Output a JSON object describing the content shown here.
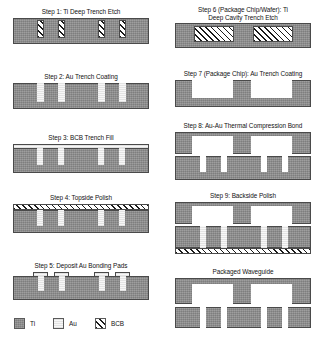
{
  "figure": {
    "colors": {
      "ti": "#8d8d8d",
      "au": "#efefef",
      "bcb_line": "#1a1a1a",
      "background": "#ffffff",
      "outline": "#4a4a4a",
      "text": "#121212"
    }
  },
  "left_column": {
    "steps": [
      {
        "id": "step-1",
        "caption": "Step 1: Ti Deep Trench Etch",
        "description": "Ti substrate with four narrow deep trenches"
      },
      {
        "id": "step-2",
        "caption": "Step 2: Au Trench Coating",
        "description": "Au lining deposited into the four trenches"
      },
      {
        "id": "step-3",
        "caption": "Step 3: BCB Trench Fill",
        "description": "BCB overcoat layer covering the coated trenches"
      },
      {
        "id": "step-4",
        "caption": "Step 4: Topside Polish",
        "description": "Topside planarized leaving a BCB band on the surface"
      },
      {
        "id": "step-5",
        "caption": "Step 5: Deposit Au Bonding Pads",
        "description": "Au bonding pads deposited above each Au-filled trench"
      }
    ]
  },
  "right_column": {
    "steps": [
      {
        "id": "step-6",
        "caption": "Step 6 (Package Chip/Wafer): Ti\nDeep Cavity Trench Etch",
        "description": "Package wafer with two wide deep cavities"
      },
      {
        "id": "step-7",
        "caption": "Step 7 (Package Chip): Au Trench Coating",
        "description": "Au coating applied to the two deep cavities"
      },
      {
        "id": "step-8",
        "caption": "Step 8: Au-Au Thermal Compression Bond",
        "description": "Package chip bonded to device wafer via Au-Au pads"
      },
      {
        "id": "step-9",
        "caption": "Step 9: Backside Polish",
        "description": "Backside polished exposing BCB band at the bottom"
      },
      {
        "id": "packaged",
        "caption": "Packaged Waveguide",
        "description": "Completed packaged waveguide cross-section"
      }
    ]
  },
  "legend": {
    "items": [
      {
        "label": "Ti",
        "material": "titanium",
        "fill": "ti"
      },
      {
        "label": "Au",
        "material": "gold",
        "fill": "au"
      },
      {
        "label": "BCB",
        "material": "benzocyclobutene",
        "fill": "bcb"
      }
    ]
  }
}
